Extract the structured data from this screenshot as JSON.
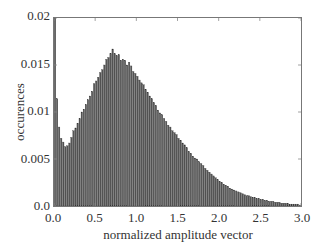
{
  "chart_data": {
    "type": "bar",
    "title": "",
    "xlabel": "normalized amplitude vector",
    "ylabel": "occurences",
    "xlim": [
      0.0,
      3.0
    ],
    "ylim": [
      0.0,
      0.02
    ],
    "xticks": [
      "0.0",
      "0.5",
      "1.0",
      "1.5",
      "2.0",
      "2.5",
      "3.0"
    ],
    "yticks": [
      "0.0",
      "0.005",
      "0.01",
      "0.015",
      "0.02"
    ],
    "grid": false,
    "legend": null,
    "bin_width": 0.025,
    "bar_color": "#555555",
    "x": [
      0.0,
      0.025,
      0.05,
      0.075,
      0.1,
      0.125,
      0.15,
      0.175,
      0.2,
      0.225,
      0.25,
      0.275,
      0.3,
      0.325,
      0.35,
      0.375,
      0.4,
      0.425,
      0.45,
      0.475,
      0.5,
      0.525,
      0.55,
      0.575,
      0.6,
      0.625,
      0.65,
      0.675,
      0.7,
      0.725,
      0.75,
      0.775,
      0.8,
      0.825,
      0.85,
      0.875,
      0.9,
      0.925,
      0.95,
      0.975,
      1.0,
      1.025,
      1.05,
      1.075,
      1.1,
      1.125,
      1.15,
      1.175,
      1.2,
      1.225,
      1.25,
      1.275,
      1.3,
      1.325,
      1.35,
      1.375,
      1.4,
      1.425,
      1.45,
      1.475,
      1.5,
      1.525,
      1.55,
      1.575,
      1.6,
      1.625,
      1.65,
      1.675,
      1.7,
      1.725,
      1.75,
      1.775,
      1.8,
      1.825,
      1.85,
      1.875,
      1.9,
      1.925,
      1.95,
      1.975,
      2.0,
      2.025,
      2.05,
      2.075,
      2.1,
      2.125,
      2.15,
      2.175,
      2.2,
      2.225,
      2.25,
      2.275,
      2.3,
      2.325,
      2.35,
      2.375,
      2.4,
      2.425,
      2.45,
      2.475,
      2.5,
      2.525,
      2.55,
      2.575,
      2.6,
      2.625,
      2.65,
      2.675,
      2.7,
      2.725,
      2.75,
      2.775,
      2.8,
      2.825,
      2.85,
      2.875,
      2.9,
      2.925,
      2.95,
      2.975
    ],
    "values": [
      0.0205,
      0.0114,
      0.0084,
      0.0072,
      0.0068,
      0.0063,
      0.0064,
      0.0067,
      0.0073,
      0.008,
      0.0083,
      0.0088,
      0.0093,
      0.01,
      0.0103,
      0.0108,
      0.0113,
      0.0117,
      0.0122,
      0.013,
      0.0133,
      0.0137,
      0.0142,
      0.0145,
      0.015,
      0.0156,
      0.0158,
      0.0162,
      0.0167,
      0.0162,
      0.016,
      0.0161,
      0.0155,
      0.0156,
      0.0155,
      0.015,
      0.0153,
      0.0149,
      0.0143,
      0.0141,
      0.0138,
      0.0134,
      0.0131,
      0.0129,
      0.0124,
      0.0121,
      0.0117,
      0.0114,
      0.011,
      0.0107,
      0.0102,
      0.0099,
      0.0097,
      0.0093,
      0.009,
      0.0086,
      0.0084,
      0.008,
      0.0078,
      0.0076,
      0.0072,
      0.007,
      0.0067,
      0.0065,
      0.0062,
      0.0058,
      0.0056,
      0.0053,
      0.0051,
      0.005,
      0.0047,
      0.0045,
      0.0043,
      0.004,
      0.0038,
      0.0036,
      0.0034,
      0.0032,
      0.003,
      0.0028,
      0.0026,
      0.0025,
      0.0023,
      0.0022,
      0.0021,
      0.0019,
      0.0018,
      0.0017,
      0.0016,
      0.0015,
      0.0014,
      0.0013,
      0.0012,
      0.0011,
      0.0011,
      0.001,
      0.0009,
      0.0009,
      0.0008,
      0.0008,
      0.0007,
      0.0007,
      0.0006,
      0.0006,
      0.0005,
      0.0005,
      0.0005,
      0.0004,
      0.0004,
      0.0004,
      0.0003,
      0.0003,
      0.0003,
      0.0003,
      0.0002,
      0.0002,
      0.0002,
      0.0002,
      0.0002,
      0.0001
    ]
  }
}
